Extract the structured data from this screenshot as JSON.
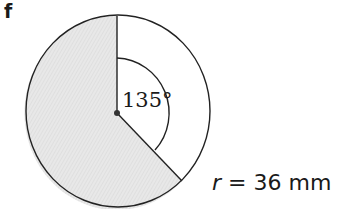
{
  "figure": {
    "label": "f",
    "angle_label": "135°",
    "radius_var": "r",
    "radius_eq": "=",
    "radius_value": "36 mm",
    "colors": {
      "shaded": "#e6e6e6",
      "stroke": "#222222"
    },
    "sector": {
      "angle_degrees": 135,
      "radius_mm": 36,
      "shaded_region": "major sector (225°)"
    }
  }
}
